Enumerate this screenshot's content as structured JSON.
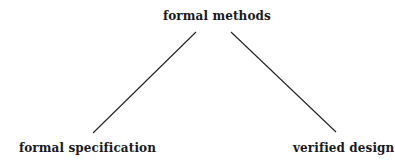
{
  "diagram": {
    "type": "tree",
    "nodes": {
      "root": {
        "label": "formal methods"
      },
      "left": {
        "label": "formal specification"
      },
      "right": {
        "label": "verified design"
      }
    },
    "edges": [
      {
        "from": "formal methods",
        "to": "formal specification"
      },
      {
        "from": "formal methods",
        "to": "verified design"
      }
    ],
    "colors": {
      "text": "#1a1a1a",
      "line": "#222222",
      "background": "#ffffff"
    }
  }
}
